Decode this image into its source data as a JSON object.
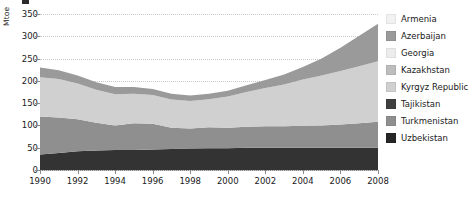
{
  "chart_data": {
    "type": "area",
    "stacked": true,
    "title": "",
    "xlabel": "",
    "ylabel": "Mtoe",
    "ylim": [
      0,
      350
    ],
    "xlim": [
      1990,
      2008
    ],
    "grid": true,
    "legend_position": "right",
    "ytick_labels": [
      "0",
      "50",
      "100",
      "150",
      "200",
      "250",
      "300",
      "350"
    ],
    "ytick_values": [
      0,
      50,
      100,
      150,
      200,
      250,
      300,
      350
    ],
    "xtick_labels": [
      "1990",
      "1992",
      "1994",
      "1996",
      "1998",
      "2000",
      "2002",
      "2004",
      "2006",
      "2008"
    ],
    "xtick_values": [
      1990,
      1992,
      1994,
      1996,
      1998,
      2000,
      2002,
      2004,
      2006,
      2008
    ],
    "x": [
      1990,
      1991,
      1992,
      1993,
      1994,
      1995,
      1996,
      1997,
      1998,
      1999,
      2000,
      2001,
      2002,
      2003,
      2004,
      2005,
      2006,
      2007,
      2008
    ],
    "series": [
      {
        "name": "Uzbekistan",
        "color": "#333333",
        "values": [
          35,
          38,
          42,
          44,
          45,
          45,
          46,
          47,
          48,
          49,
          49,
          50,
          50,
          50,
          50,
          50,
          50,
          50,
          50
        ]
      },
      {
        "name": "Turkmenistan",
        "color": "#8f8f8f",
        "values": [
          85,
          80,
          72,
          62,
          55,
          60,
          58,
          48,
          45,
          47,
          46,
          47,
          48,
          48,
          49,
          50,
          52,
          55,
          58
        ]
      },
      {
        "name": "Tajikistan",
        "color": "#3f3f3f",
        "values": [
          0,
          0,
          0,
          0,
          0,
          0,
          0,
          0,
          0,
          0,
          0,
          0,
          0,
          0,
          0,
          0,
          0,
          0,
          0
        ]
      },
      {
        "name": "Kyrgyz Republic",
        "color": "#d0d0d0",
        "values": [
          88,
          86,
          80,
          74,
          70,
          66,
          64,
          63,
          62,
          63,
          70,
          78,
          86,
          94,
          104,
          112,
          120,
          128,
          136
        ]
      },
      {
        "name": "Kazakhstan",
        "color": "#bdbdbd",
        "values": [
          0,
          0,
          0,
          0,
          0,
          0,
          0,
          0,
          0,
          0,
          0,
          0,
          0,
          0,
          0,
          0,
          0,
          0,
          0
        ]
      },
      {
        "name": "Georgia",
        "color": "#ececec",
        "values": [
          0,
          0,
          0,
          0,
          0,
          0,
          0,
          0,
          0,
          0,
          0,
          0,
          0,
          0,
          0,
          0,
          0,
          0,
          0
        ]
      },
      {
        "name": "Azerbaijan",
        "color": "#9a9a9a",
        "values": [
          22,
          20,
          18,
          17,
          16,
          15,
          14,
          13,
          12,
          12,
          13,
          15,
          18,
          22,
          28,
          38,
          52,
          68,
          84
        ]
      },
      {
        "name": "Armenia",
        "color": "#f2f2f2",
        "values": [
          0,
          0,
          0,
          0,
          0,
          0,
          0,
          0,
          0,
          0,
          0,
          0,
          0,
          0,
          0,
          0,
          0,
          0,
          0
        ]
      }
    ],
    "totals": [
      230,
      224,
      212,
      197,
      186,
      186,
      182,
      171,
      167,
      171,
      178,
      190,
      202,
      214,
      231,
      250,
      274,
      301,
      328
    ],
    "annotations": []
  },
  "legend": {
    "items": [
      {
        "label": "Armenia",
        "color": "#f2f2f2"
      },
      {
        "label": "Azerbaijan",
        "color": "#9a9a9a"
      },
      {
        "label": "Georgia",
        "color": "#ececec"
      },
      {
        "label": "Kazakhstan",
        "color": "#bdbdbd"
      },
      {
        "label": "Kyrgyz Republic",
        "color": "#d0d0d0"
      },
      {
        "label": "Tajikistan",
        "color": "#3f3f3f"
      },
      {
        "label": "Turkmenistan",
        "color": "#8f8f8f"
      },
      {
        "label": "Uzbekistan",
        "color": "#262626"
      }
    ]
  },
  "axis": {
    "y_title": "Mtoe"
  },
  "colors": {
    "grid": "#c9c9c9",
    "axis": "#8a8a8a",
    "text": "#1a1a1a",
    "background": "#ffffff"
  }
}
